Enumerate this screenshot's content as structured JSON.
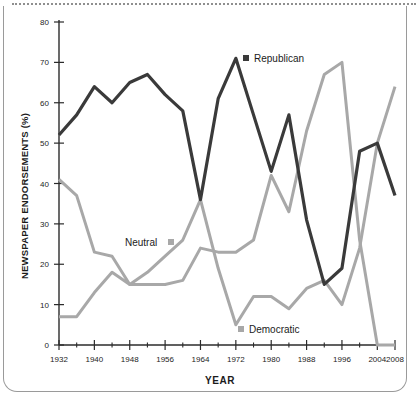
{
  "figure": {
    "y_axis_title": "NEWSPAPER ENDORSEMENTS (%)",
    "x_axis_title": "YEAR"
  },
  "legend": {
    "republican": "Republican",
    "neutral": "Neutral",
    "democratic": "Democratic"
  },
  "colors": {
    "republican": "#3a3a3a",
    "neutral": "#a8a8a8",
    "democratic": "#a8a8a8",
    "axis": "#2b2b2b",
    "frame": "#9a9a9a",
    "background": "#ffffff"
  },
  "ticks": {
    "y": [
      "0",
      "10",
      "20",
      "30",
      "40",
      "50",
      "60",
      "70",
      "80"
    ],
    "x_major": [
      "1932",
      "1940",
      "1948",
      "1956",
      "1964",
      "1972",
      "1980",
      "1988",
      "1996",
      "2004",
      "2008"
    ],
    "x_minor": [
      "1936",
      "1944",
      "1952",
      "1960",
      "1968",
      "1976",
      "1984",
      "1992",
      "2000"
    ]
  },
  "chart_data": {
    "type": "line",
    "title": "",
    "xlabel": "YEAR",
    "ylabel": "NEWSPAPER ENDORSEMENTS (%)",
    "xlim": [
      1932,
      2008
    ],
    "ylim": [
      0,
      80
    ],
    "grid": false,
    "legend_position": "inline-annotations",
    "x": [
      1932,
      1936,
      1940,
      1944,
      1948,
      1952,
      1956,
      1960,
      1964,
      1968,
      1972,
      1976,
      1980,
      1984,
      1988,
      1992,
      1996,
      2000,
      2004,
      2008
    ],
    "series": [
      {
        "name": "Republican",
        "color": "#3a3a3a",
        "values": [
          52,
          57,
          64,
          60,
          65,
          67,
          62,
          58,
          36,
          61,
          71,
          57,
          43,
          57,
          31,
          15,
          19,
          48,
          50,
          37
        ]
      },
      {
        "name": "Neutral",
        "color": "#a8a8a8",
        "values": [
          41,
          37,
          23,
          22,
          15,
          15,
          15,
          16,
          24,
          23,
          23,
          26,
          42,
          33,
          53,
          67,
          70,
          26,
          0,
          0
        ]
      },
      {
        "name": "Democratic",
        "color": "#a8a8a8",
        "values": [
          7,
          7,
          13,
          18,
          15,
          18,
          22,
          26,
          36,
          19,
          5,
          12,
          12,
          9,
          14,
          16,
          10,
          24,
          50,
          64
        ]
      }
    ]
  }
}
